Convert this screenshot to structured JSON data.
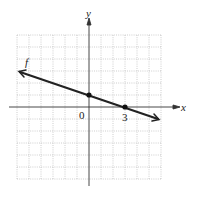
{
  "figure": {
    "function_label": "f",
    "x_axis_label": "x",
    "y_axis_label": "y",
    "origin_label": "0",
    "x_tick_label": "3",
    "grid": {
      "x_min": -6,
      "x_max": 6,
      "y_min": -6,
      "y_max": 6,
      "step": 1
    },
    "line": {
      "slope": -0.3333,
      "intercept": 1,
      "equation": "y = -x/3 + 1"
    },
    "points": [
      {
        "x": 0,
        "y": 1
      },
      {
        "x": 3,
        "y": 0
      }
    ],
    "colors": {
      "grid": "#b0b0b0",
      "axes": "#333333",
      "line": "#222222"
    }
  }
}
